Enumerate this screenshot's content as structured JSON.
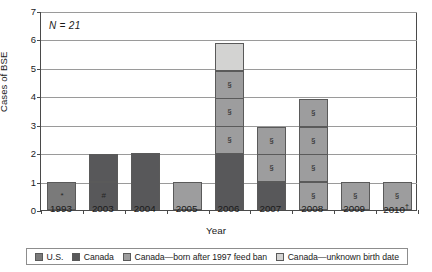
{
  "chart_data": {
    "type": "bar",
    "title": "",
    "subtitle": "",
    "xlabel": "Year",
    "ylabel": "Cases of BSE",
    "annotation": "N = 21",
    "annotation_n_italic": "N",
    "annotation_rest": " = 21",
    "ylim": [
      0,
      7
    ],
    "yticks": [
      0,
      1,
      2,
      3,
      4,
      5,
      6,
      7
    ],
    "grid": true,
    "stacked": true,
    "legend_position": "bottom",
    "categories": [
      "1993",
      "2003",
      "2004",
      "2005",
      "2006",
      "2007",
      "2008",
      "2009",
      "2010†"
    ],
    "totals": [
      1,
      2,
      2,
      1,
      6,
      3,
      4,
      1,
      1
    ],
    "series": [
      {
        "name": "U.S.",
        "key": "us",
        "color": "#7a7a7a",
        "values": [
          1,
          0,
          0,
          0,
          0,
          0,
          0,
          0,
          0
        ]
      },
      {
        "name": "Canada",
        "key": "canada",
        "color": "#58585a",
        "values": [
          0,
          2,
          2,
          0,
          2,
          1,
          0,
          0,
          0
        ]
      },
      {
        "name": "Canada—born after 1997 feed ban",
        "key": "after_ban",
        "color": "#9d9d9e",
        "values": [
          0,
          0,
          0,
          1,
          3,
          2,
          4,
          1,
          1
        ]
      },
      {
        "name": "Canada—unknown birth date",
        "key": "unknown_dob",
        "color": "#d3d3d2",
        "values": [
          0,
          0,
          0,
          0,
          1,
          0,
          0,
          0,
          0
        ]
      }
    ],
    "bar_stacks": [
      {
        "year": "1993",
        "segments": [
          {
            "series": "U.S.",
            "color": "#7a7a7a",
            "size": 1,
            "marker": "*"
          }
        ]
      },
      {
        "year": "2003",
        "segments": [
          {
            "series": "Canada",
            "color": "#58585a",
            "size": 1,
            "marker": "#"
          },
          {
            "series": "Canada",
            "color": "#58585a",
            "size": 1,
            "marker": ""
          }
        ]
      },
      {
        "year": "2004",
        "segments": [
          {
            "series": "Canada",
            "color": "#58585a",
            "size": 2,
            "marker": ""
          }
        ]
      },
      {
        "year": "2005",
        "segments": [
          {
            "series": "Canada—born after 1997 feed ban",
            "color": "#9d9d9e",
            "size": 1,
            "marker": ""
          }
        ]
      },
      {
        "year": "2006",
        "segments": [
          {
            "series": "Canada",
            "color": "#58585a",
            "size": 2,
            "marker": ""
          },
          {
            "series": "Canada—born after 1997 feed ban",
            "color": "#9d9d9e",
            "size": 1,
            "marker": "§"
          },
          {
            "series": "Canada—born after 1997 feed ban",
            "color": "#9d9d9e",
            "size": 1,
            "marker": "§"
          },
          {
            "series": "Canada—born after 1997 feed ban",
            "color": "#9d9d9e",
            "size": 1,
            "marker": "§"
          },
          {
            "series": "Canada—unknown birth date",
            "color": "#d3d3d2",
            "size": 1,
            "marker": ""
          }
        ]
      },
      {
        "year": "2007",
        "segments": [
          {
            "series": "Canada",
            "color": "#58585a",
            "size": 1,
            "marker": ""
          },
          {
            "series": "Canada—born after 1997 feed ban",
            "color": "#9d9d9e",
            "size": 1,
            "marker": "§"
          },
          {
            "series": "Canada—born after 1997 feed ban",
            "color": "#9d9d9e",
            "size": 1,
            "marker": "§"
          }
        ]
      },
      {
        "year": "2008",
        "segments": [
          {
            "series": "Canada—born after 1997 feed ban",
            "color": "#9d9d9e",
            "size": 1,
            "marker": "§"
          },
          {
            "series": "Canada—born after 1997 feed ban",
            "color": "#9d9d9e",
            "size": 1,
            "marker": "§"
          },
          {
            "series": "Canada—born after 1997 feed ban",
            "color": "#9d9d9e",
            "size": 1,
            "marker": "§"
          },
          {
            "series": "Canada—born after 1997 feed ban",
            "color": "#9d9d9e",
            "size": 1,
            "marker": "§"
          }
        ]
      },
      {
        "year": "2009",
        "segments": [
          {
            "series": "Canada—born after 1997 feed ban",
            "color": "#9d9d9e",
            "size": 1,
            "marker": "§"
          }
        ]
      },
      {
        "year": "2010†",
        "segments": [
          {
            "series": "Canada—born after 1997 feed ban",
            "color": "#9d9d9e",
            "size": 1,
            "marker": "§"
          }
        ]
      }
    ],
    "markers": {
      "asterisk": "*",
      "hash": "#",
      "section": "§",
      "dagger": "†"
    }
  },
  "legend": {
    "items": [
      {
        "label": "U.S.",
        "color": "#7a7a7a"
      },
      {
        "label": "Canada",
        "color": "#58585a"
      },
      {
        "label": "Canada—born after 1997 feed ban",
        "color": "#9d9d9e"
      },
      {
        "label": "Canada—unknown birth date",
        "color": "#d3d3d2"
      }
    ]
  }
}
